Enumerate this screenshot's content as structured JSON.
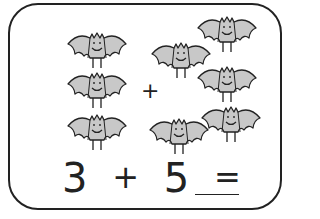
{
  "worksheet": {
    "group_a_count": 3,
    "group_b_count": 5,
    "operator_between_groups": "+",
    "equation": {
      "left": "3",
      "op": "+",
      "right": "5",
      "equals": "=",
      "answer_blank": ""
    },
    "icon": "bat-icon",
    "colors": {
      "bat_fill": "#c8c8c8",
      "stroke": "#222222",
      "border": "#222222"
    }
  },
  "bats": [
    {
      "group": "a",
      "x": 66,
      "y": 28
    },
    {
      "group": "a",
      "x": 66,
      "y": 68
    },
    {
      "group": "a",
      "x": 66,
      "y": 110
    },
    {
      "group": "b",
      "x": 150,
      "y": 38
    },
    {
      "group": "b",
      "x": 196,
      "y": 12
    },
    {
      "group": "b",
      "x": 196,
      "y": 62
    },
    {
      "group": "b",
      "x": 200,
      "y": 102
    },
    {
      "group": "b",
      "x": 148,
      "y": 114
    }
  ]
}
